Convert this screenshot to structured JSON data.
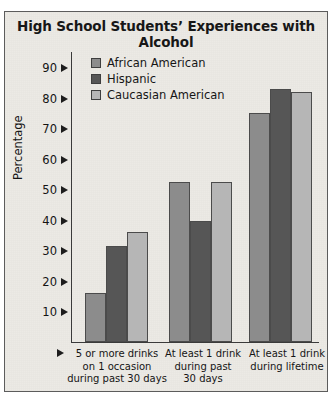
{
  "page": {
    "cut_caption": "A VERTICAL GRAPH"
  },
  "chart_data": {
    "type": "bar",
    "title": "High School Students’ Experiences with Alcohol",
    "xlabel": "",
    "ylabel": "Percentage",
    "ylim": [
      0,
      95
    ],
    "yticks": [
      10,
      20,
      30,
      40,
      50,
      60,
      70,
      80,
      90
    ],
    "grid": false,
    "legend_position": "top-left-inside",
    "categories": [
      "5 or more drinks\non 1 occasion\nduring past 30 days",
      "At least 1 drink\nduring past\n30 days",
      "At least 1 drink\nduring lifetime"
    ],
    "category_lines": [
      [
        "5 or more drinks",
        "on 1 occasion",
        "during past 30 days"
      ],
      [
        "At least 1 drink",
        "during past",
        "30 days"
      ],
      [
        "At least 1 drink",
        "during lifetime"
      ]
    ],
    "series": [
      {
        "name": "African American",
        "color": "#8c8c8c",
        "values": [
          16,
          52.5,
          75
        ]
      },
      {
        "name": "Hispanic",
        "color": "#565656",
        "values": [
          31.5,
          39.5,
          83
        ]
      },
      {
        "name": "Caucasian American",
        "color": "#b6b6b6",
        "values": [
          36,
          52.5,
          82
        ]
      }
    ]
  }
}
